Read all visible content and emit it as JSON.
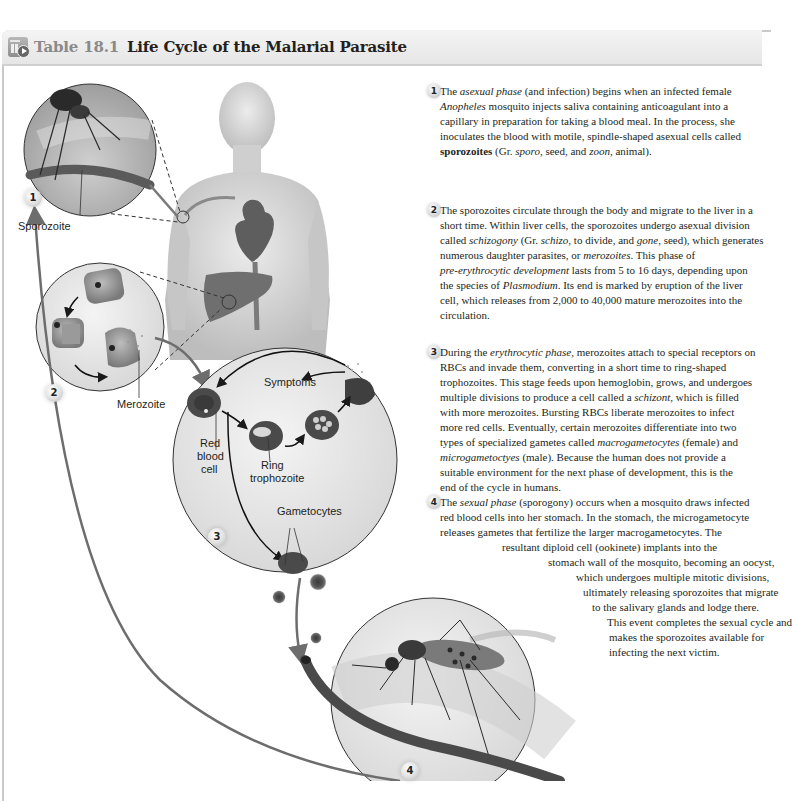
{
  "header": {
    "icon": "table-media-icon",
    "label": "Table 18.1",
    "title": "Life Cycle of the Malarial Parasite"
  },
  "diagram": {
    "labels": {
      "sporozoite": "Sporozoite",
      "merozoite": "Merozoite",
      "symptoms": "Symptoms",
      "red_blood_cell": [
        "Red",
        "blood",
        "cell"
      ],
      "ring_trophozoite": [
        "Ring",
        "trophozoite"
      ],
      "gametocytes": "Gametocytes"
    },
    "badges": [
      "1",
      "2",
      "3",
      "4"
    ]
  },
  "steps": [
    {
      "number": "1",
      "lines": [
        [
          {
            "t": "The "
          },
          {
            "t": "asexual phase",
            "i": true
          },
          {
            "t": " (and infection) begins when an infected female"
          }
        ],
        [
          {
            "t": "Anopheles",
            "i": true
          },
          {
            "t": " mosquito injects saliva containing anticoagulant into a"
          }
        ],
        [
          {
            "t": "capillary in preparation for taking a blood meal. In the process, she"
          }
        ],
        [
          {
            "t": "inoculates the blood with motile, spindle-shaped asexual cells called"
          }
        ],
        [
          {
            "t": "sporozoites",
            "b": true
          },
          {
            "t": " (Gr. "
          },
          {
            "t": "sporo,",
            "i": true
          },
          {
            "t": " seed, and "
          },
          {
            "t": "zoon,",
            "i": true
          },
          {
            "t": " animal)."
          }
        ]
      ]
    },
    {
      "number": "2",
      "lines": [
        [
          {
            "t": "The sporozoites circulate through the body and migrate to the liver in a"
          }
        ],
        [
          {
            "t": "short time. Within liver cells, the sporozoites undergo asexual division"
          }
        ],
        [
          {
            "t": "called "
          },
          {
            "t": "schizogony",
            "i": true
          },
          {
            "t": " (Gr. "
          },
          {
            "t": "schizo,",
            "i": true
          },
          {
            "t": " to divide, and "
          },
          {
            "t": "gone,",
            "i": true
          },
          {
            "t": " seed), which generates"
          }
        ],
        [
          {
            "t": "numerous daughter parasites, or "
          },
          {
            "t": "merozoites",
            "i": true
          },
          {
            "t": ". This phase of"
          }
        ],
        [
          {
            "t": "pre-erythrocytic development",
            "i": true
          },
          {
            "t": " lasts from 5 to 16 days, depending upon"
          }
        ],
        [
          {
            "t": "the species of "
          },
          {
            "t": "Plasmodium",
            "i": true
          },
          {
            "t": ". Its end is marked by eruption of the liver"
          }
        ],
        [
          {
            "t": "cell, which releases from 2,000 to 40,000 mature merozoites into the"
          }
        ],
        [
          {
            "t": "circulation."
          }
        ]
      ]
    },
    {
      "number": "3",
      "lines": [
        [
          {
            "t": "During the "
          },
          {
            "t": "erythrocytic phase,",
            "i": true
          },
          {
            "t": " merozoites attach to special receptors on"
          }
        ],
        [
          {
            "t": "RBCs and invade them, converting in a short time to ring-shaped"
          }
        ],
        [
          {
            "t": "trophozoites. This stage feeds upon hemoglobin, grows, and undergoes"
          }
        ],
        [
          {
            "t": "multiple divisions to produce a cell called a "
          },
          {
            "t": "schizont,",
            "i": true
          },
          {
            "t": " which is filled"
          }
        ],
        [
          {
            "t": "with more merozoites. Bursting RBCs liberate merozoites to infect"
          }
        ],
        [
          {
            "t": "more red cells. Eventually, certain merozoites differentiate into two"
          }
        ],
        [
          {
            "t": "types of specialized gametes called "
          },
          {
            "t": "macrogametocytes",
            "i": true
          },
          {
            "t": " (female) and"
          }
        ],
        [
          {
            "t": "microgametoctyes",
            "i": true
          },
          {
            "t": " (male). Because the human does not provide a"
          }
        ],
        [
          {
            "t": "suitable environment for the next phase of development, this is the"
          }
        ],
        [
          {
            "t": "end of the cycle in humans."
          }
        ]
      ]
    },
    {
      "number": "4",
      "lines": [
        [
          {
            "t": "The "
          },
          {
            "t": "sexual phase",
            "i": true
          },
          {
            "t": " (sporogony) occurs when a mosquito draws infected"
          }
        ],
        [
          {
            "t": "red blood cells into her stomach. In the stomach, the microgametocyte"
          }
        ],
        [
          {
            "t": "releases gametes that fertilize the larger macrogametocytes. The"
          }
        ],
        [
          {
            "t": "resultant diploid cell (ookinete) implants into the"
          }
        ],
        [
          {
            "t": "stomach wall of the mosquito, becoming an oocyst,"
          }
        ],
        [
          {
            "t": "which undergoes multiple mitotic divisions,"
          }
        ],
        [
          {
            "t": "ultimately releasing sporozoites that migrate"
          }
        ],
        [
          {
            "t": "to the salivary glands and lodge there."
          }
        ],
        [
          {
            "t": "This event completes the sexual cycle and"
          }
        ],
        [
          {
            "t": "makes the sporozoites available for"
          }
        ],
        [
          {
            "t": "infecting the next victim."
          }
        ]
      ],
      "indents": [
        0,
        0,
        0,
        62,
        108,
        136,
        143,
        152,
        167,
        169,
        169
      ]
    }
  ],
  "colors": {
    "header_bg": "#e9e9e9",
    "header_label": "#8a8a8a",
    "text": "#231f20",
    "arrow_grey": "#6d6d6d",
    "rbc_dark": "#4a4a4a"
  }
}
